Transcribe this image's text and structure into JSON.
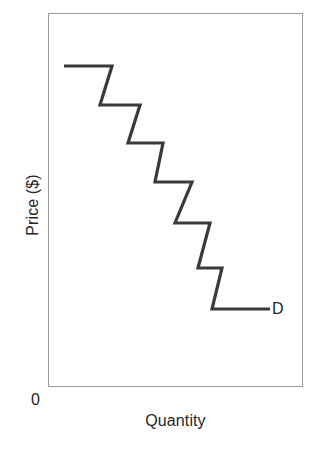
{
  "figure": {
    "background_color": "#ffffff",
    "frame_color": "#9a9a9a",
    "curve_color": "#3a3a3a"
  },
  "labels": {
    "y_axis_title": "Price ($)",
    "x_axis_title": "Quantity",
    "origin": "0",
    "curve_label": "D"
  },
  "chart_data": {
    "type": "line",
    "title": "",
    "subtitle": "",
    "xlabel": "Quantity",
    "ylabel": "Price ($)",
    "grid": false,
    "legend": "none",
    "annotations": [
      {
        "text": "D",
        "meaning": "demand curve label",
        "x": 8.9,
        "y": 2.1
      },
      {
        "text": "0",
        "meaning": "origin marker at axis corner",
        "x": 0,
        "y": 0
      }
    ],
    "xlim": [
      0,
      10
    ],
    "ylim": [
      0,
      10
    ],
    "axis_ticks": {
      "x": [],
      "y": []
    },
    "series": [
      {
        "name": "D",
        "description": "Downward-sloping stepped demand curve with seven price steps",
        "drawstyle": "steps-post",
        "step_count": 7,
        "points": [
          {
            "x": 0.6,
            "y": 8.6
          },
          {
            "x": 2.5,
            "y": 8.6
          },
          {
            "x": 2.0,
            "y": 7.5
          },
          {
            "x": 3.6,
            "y": 7.5
          },
          {
            "x": 3.1,
            "y": 6.5
          },
          {
            "x": 4.5,
            "y": 6.5
          },
          {
            "x": 4.0,
            "y": 5.4
          },
          {
            "x": 5.6,
            "y": 5.4
          },
          {
            "x": 5.0,
            "y": 4.3
          },
          {
            "x": 6.4,
            "y": 4.3
          },
          {
            "x": 5.9,
            "y": 3.2
          },
          {
            "x": 6.8,
            "y": 3.2
          },
          {
            "x": 6.4,
            "y": 2.1
          },
          {
            "x": 8.7,
            "y": 2.1
          }
        ],
        "pixel_polyline": "64,66 112,66 100,105 140,105 128,143 163,143 155,182 192,182 175,223 210,223 198,268 222,268 212,309 270,309"
      }
    ]
  }
}
